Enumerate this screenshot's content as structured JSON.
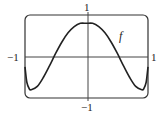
{
  "chart_data": {
    "type": "line",
    "title": "",
    "xlabel": "",
    "ylabel": "",
    "xlim": [
      -1,
      1
    ],
    "ylim": [
      -1,
      1
    ],
    "grid": false,
    "legend": "none",
    "tick_labels": {
      "x_left": "−1",
      "x_right": "1",
      "y_top": "1",
      "y_bottom": "−1"
    },
    "series": [
      {
        "name": "f",
        "x": [
          -1.0,
          -0.97,
          -0.93,
          -0.9,
          -0.8,
          -0.7,
          -0.6,
          -0.5,
          -0.4,
          -0.3,
          -0.2,
          -0.1,
          0.0,
          0.1,
          0.2,
          0.3,
          0.4,
          0.5,
          0.6,
          0.7,
          0.8,
          0.9,
          0.93,
          0.97,
          1.0
        ],
        "values": [
          -0.25,
          -0.62,
          -0.78,
          -0.8,
          -0.72,
          -0.5,
          -0.22,
          0.08,
          0.35,
          0.57,
          0.72,
          0.8,
          0.8,
          0.8,
          0.72,
          0.57,
          0.35,
          0.08,
          -0.22,
          -0.5,
          -0.72,
          -0.8,
          -0.78,
          -0.62,
          -0.25
        ]
      }
    ],
    "annotations": [
      {
        "text": "f",
        "x": 0.55,
        "y": 0.5
      }
    ]
  },
  "labels": {
    "y_top": "1",
    "y_bottom": "−1",
    "x_left": "−1",
    "x_right": "1",
    "curve": "f"
  }
}
